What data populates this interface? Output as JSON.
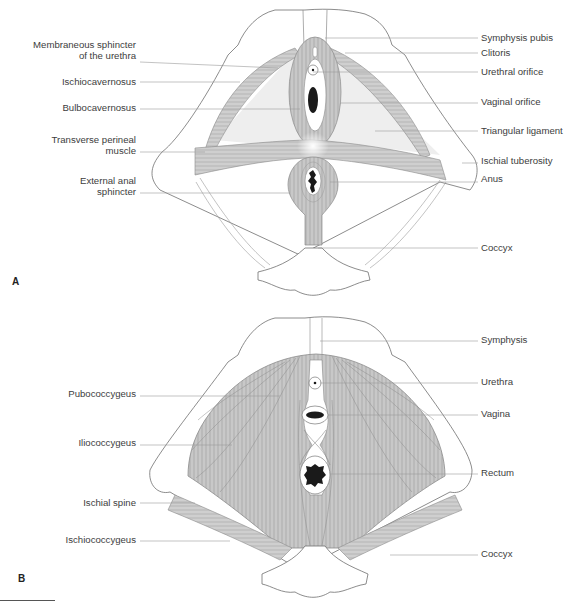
{
  "panels": [
    {
      "id": "A",
      "letter": "A",
      "left_labels": [
        {
          "text_line1": "Membraneous sphincter",
          "text_line2": "of the urethra"
        },
        {
          "text_line1": "Ischiocavernosus"
        },
        {
          "text_line1": "Bulbocavernosus"
        },
        {
          "text_line1": "Transverse perineal",
          "text_line2": "muscle"
        },
        {
          "text_line1": "External anal",
          "text_line2": "sphincter"
        }
      ],
      "right_labels": [
        "Symphysis pubis",
        "Clitoris",
        "Urethral orifice",
        "Vaginal orifice",
        "Triangular ligament",
        "Ischial tuberosity",
        "Anus",
        "Coccyx"
      ]
    },
    {
      "id": "B",
      "letter": "B",
      "left_labels": [
        "Pubococcygeus",
        "Iliococcygeus",
        "Ischial spine",
        "Ischiococcygeus"
      ],
      "right_labels": [
        "Symphysis",
        "Urethra",
        "Vagina",
        "Rectum",
        "Coccyx"
      ]
    }
  ],
  "colors": {
    "muscle_fill": "#c9c9c9",
    "muscle_stroke": "#8a8a8a",
    "bone_stroke": "#6e6e6e",
    "leader_line": "#9a9a9a",
    "ligament_fill": "#ececec",
    "orifice": "#1a1a1a"
  }
}
